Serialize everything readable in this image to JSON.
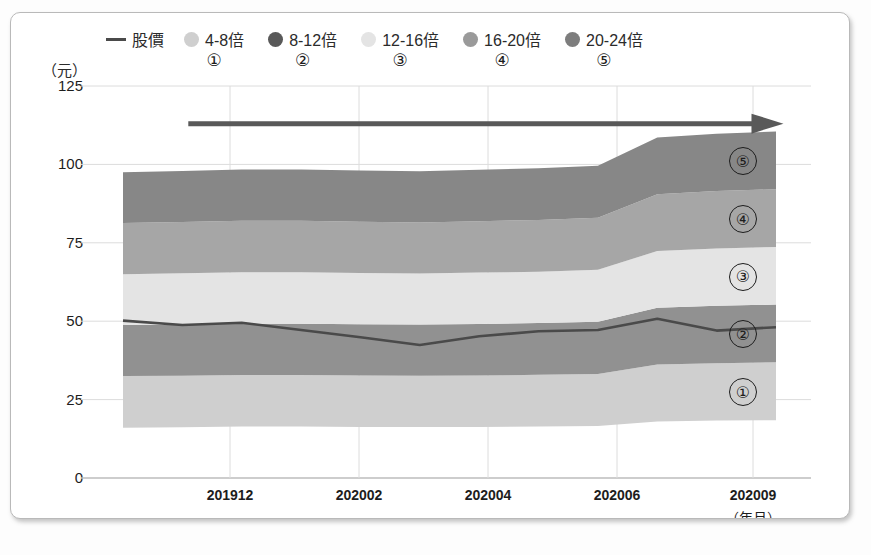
{
  "legend": {
    "items": [
      {
        "label": "股價",
        "marker": "line",
        "color": "#4a4a4a",
        "number": ""
      },
      {
        "label": "4-8倍",
        "marker": "dot",
        "color": "#cfcfcf",
        "number": "①"
      },
      {
        "label": "8-12倍",
        "marker": "dot",
        "color": "#595959",
        "number": "②"
      },
      {
        "label": "12-16倍",
        "marker": "dot",
        "color": "#e4e4e4",
        "number": "③"
      },
      {
        "label": "16-20倍",
        "marker": "dot",
        "color": "#9a9a9a",
        "number": "④"
      },
      {
        "label": "20-24倍",
        "marker": "dot",
        "color": "#7d7d7d",
        "number": "⑤"
      }
    ]
  },
  "axes": {
    "y_unit": "（元）",
    "x_unit": "（年月）",
    "y_ticks": [
      "125",
      "100",
      "75",
      "50",
      "25",
      "0"
    ],
    "x_ticks": [
      "201912",
      "202002",
      "202004",
      "202006",
      "202009"
    ]
  },
  "band_markers": [
    {
      "number": "⑤"
    },
    {
      "number": "④"
    },
    {
      "number": "③"
    },
    {
      "number": "②"
    },
    {
      "number": "①"
    }
  ],
  "chart_data": {
    "type": "area",
    "title": "",
    "xlabel": "（年月）",
    "ylabel": "（元）",
    "ylim": [
      0,
      125
    ],
    "grid": true,
    "legend_position": "top",
    "x": [
      "201910",
      "201911",
      "201912",
      "202001",
      "202002",
      "202003",
      "202004",
      "202005",
      "202006",
      "202007",
      "202008",
      "202009"
    ],
    "x_tick_labels": [
      "201912",
      "202002",
      "202004",
      "202006",
      "202009"
    ],
    "y_ticks": [
      0,
      25,
      50,
      75,
      100,
      125
    ],
    "bands": [
      {
        "name": "4-8倍",
        "number": "①",
        "color": "#cfcfcf",
        "lower": [
          16.0,
          16.2,
          16.4,
          16.4,
          16.3,
          16.3,
          16.3,
          16.4,
          16.6,
          18.0,
          18.3,
          18.4
        ],
        "upper": [
          32.5,
          32.6,
          32.8,
          32.8,
          32.7,
          32.6,
          32.7,
          32.9,
          33.2,
          36.2,
          36.6,
          36.9
        ]
      },
      {
        "name": "8-12倍",
        "number": "②",
        "color": "#919191",
        "lower": [
          32.5,
          32.6,
          32.8,
          32.8,
          32.7,
          32.6,
          32.7,
          32.9,
          33.2,
          36.2,
          36.6,
          36.9
        ],
        "upper": [
          48.8,
          49.0,
          49.2,
          49.2,
          49.0,
          48.9,
          49.1,
          49.4,
          49.8,
          54.3,
          54.9,
          55.3
        ]
      },
      {
        "name": "12-16倍",
        "number": "③",
        "color": "#e4e4e4",
        "lower": [
          48.8,
          49.0,
          49.2,
          49.2,
          49.0,
          48.9,
          49.1,
          49.4,
          49.8,
          54.3,
          54.9,
          55.3
        ],
        "upper": [
          65.0,
          65.3,
          65.6,
          65.6,
          65.4,
          65.2,
          65.5,
          65.8,
          66.4,
          72.4,
          73.2,
          73.7
        ]
      },
      {
        "name": "16-20倍",
        "number": "④",
        "color": "#a6a6a6",
        "lower": [
          65.0,
          65.3,
          65.6,
          65.6,
          65.4,
          65.2,
          65.5,
          65.8,
          66.4,
          72.4,
          73.2,
          73.7
        ],
        "upper": [
          81.3,
          81.6,
          82.0,
          82.0,
          81.7,
          81.5,
          81.9,
          82.3,
          83.0,
          90.5,
          91.5,
          92.1
        ]
      },
      {
        "name": "20-24倍",
        "number": "⑤",
        "color": "#878787",
        "lower": [
          81.3,
          81.6,
          82.0,
          82.0,
          81.7,
          81.5,
          81.9,
          82.3,
          83.0,
          90.5,
          91.5,
          92.1
        ],
        "upper": [
          97.5,
          97.9,
          98.4,
          98.4,
          98.1,
          97.8,
          98.3,
          98.8,
          99.6,
          108.6,
          109.8,
          110.5
        ]
      }
    ],
    "series": [
      {
        "name": "股價",
        "type": "line",
        "color": "#4a4a4a",
        "values": [
          50.2,
          48.8,
          49.5,
          47.2,
          44.9,
          42.4,
          45.2,
          46.8,
          47.2,
          50.8,
          47.0,
          48.1
        ]
      }
    ],
    "annotations": [
      {
        "type": "arrow",
        "direction": "right",
        "color": "#595959",
        "x_start_frac": 0.1,
        "x_end_frac": 0.99,
        "y_value": 113
      }
    ]
  }
}
